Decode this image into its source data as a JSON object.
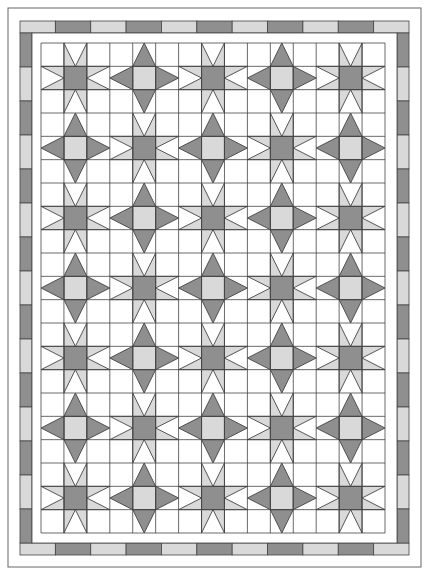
{
  "quilt": {
    "title": "Star quilt layout",
    "canvas": {
      "width": 429,
      "height": 575
    },
    "colors": {
      "background": "#ffffff",
      "dark": "#8f8f8f",
      "light": "#d9d9d9",
      "white": "#ffffff",
      "line": "#444444",
      "outer_line": "#666666"
    },
    "outer_border": {
      "x": 8,
      "y": 8,
      "width": 413,
      "height": 559
    },
    "pieced_border": {
      "outer": {
        "x": 20,
        "y": 21,
        "width": 389,
        "height": 534
      },
      "thickness": 12,
      "top_segments": [
        "light",
        "dark",
        "light",
        "dark",
        "light",
        "dark",
        "light",
        "dark",
        "light",
        "dark",
        "light"
      ],
      "bottom_segments": [
        "light",
        "dark",
        "light",
        "dark",
        "light",
        "dark",
        "light",
        "dark",
        "light",
        "dark",
        "light"
      ],
      "side_segments": [
        "dark",
        "light",
        "dark",
        "light",
        "dark",
        "light",
        "dark",
        "light",
        "dark",
        "light",
        "dark",
        "light",
        "dark",
        "light",
        "dark"
      ]
    },
    "inner_border": {
      "x": 32,
      "y": 33,
      "width": 365,
      "height": 510
    },
    "grid": {
      "x": 41,
      "y": 43,
      "width": 344,
      "height": 490,
      "block_cols": 5,
      "block_rows": 7,
      "cells_per_block": 3
    },
    "block_types": {
      "A": {
        "name": "sawtooth-star",
        "center": "dark",
        "arms": "light-with-white-notch"
      },
      "B": {
        "name": "diamond-star",
        "center": "light",
        "arms": "dark-triangle"
      }
    },
    "layout": [
      [
        "A",
        "B",
        "A",
        "B",
        "A"
      ],
      [
        "B",
        "A",
        "B",
        "A",
        "B"
      ],
      [
        "A",
        "B",
        "A",
        "B",
        "A"
      ],
      [
        "B",
        "A",
        "B",
        "A",
        "B"
      ],
      [
        "A",
        "B",
        "A",
        "B",
        "A"
      ],
      [
        "B",
        "A",
        "B",
        "A",
        "B"
      ],
      [
        "A",
        "B",
        "A",
        "B",
        "A"
      ]
    ]
  }
}
